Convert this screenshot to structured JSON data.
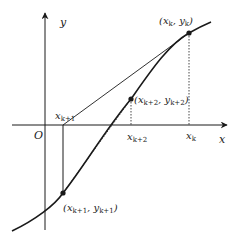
{
  "diagram": {
    "colors": {
      "stroke": "#1a1a1a",
      "text": "#222222",
      "background": "#ffffff"
    },
    "axes": {
      "x_label": "x",
      "y_label": "y",
      "origin_label": "O"
    },
    "tick_labels": {
      "x_k1": "x",
      "x_k1_sub": "k+1",
      "x_k2": "x",
      "x_k2_sub": "k+2",
      "x_k": "x",
      "x_k_sub": "k"
    },
    "points": [
      {
        "id": "pk",
        "label_open": "(x",
        "sub1": "k",
        "mid": ", y",
        "sub2": "k",
        "close": ")"
      },
      {
        "id": "pk2",
        "label_open": "(x",
        "sub1": "k+2",
        "mid": ", y",
        "sub2": "k+2",
        "close": ")"
      },
      {
        "id": "pk1",
        "label_open": "(x",
        "sub1": "k+1",
        "mid": ", y",
        "sub2": "k+1",
        "close": ")"
      }
    ]
  }
}
